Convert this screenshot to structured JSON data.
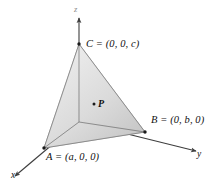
{
  "figure": {
    "type": "3d-coordinate-diagram",
    "background_color": "#ffffff",
    "stroke_color": "#4a4a4a",
    "label_color": "#111111"
  },
  "axes": [
    {
      "name": "x-axis",
      "label": "x",
      "arrow_direction": "down-left"
    },
    {
      "name": "y-axis",
      "label": "y",
      "arrow_direction": "right"
    },
    {
      "name": "z-axis",
      "label": "z",
      "arrow_direction": "up"
    }
  ],
  "vertices": [
    {
      "name": "vertex-A",
      "label": "A = (a, 0, 0)",
      "point": "A",
      "coordinates": "(a, 0, 0)",
      "on_axis": "x"
    },
    {
      "name": "vertex-B",
      "label": "B = (0, b, 0)",
      "point": "B",
      "coordinates": "(0, b, 0)",
      "on_axis": "y"
    },
    {
      "name": "vertex-C",
      "label": "C = (0, 0, c)",
      "point": "C",
      "coordinates": "(0, 0, c)",
      "on_axis": "z"
    }
  ],
  "interior_point": {
    "name": "point-P",
    "label": "P",
    "marker": "dot"
  },
  "faces": [
    {
      "name": "face-ABC",
      "description": "slanted front face through A, B and C",
      "fill_light": "#e9e9e9",
      "fill_dark": "#c6c6c6"
    },
    {
      "name": "face-OAC",
      "description": "face in the xz-plane through origin, A and C",
      "fill_light": "#f5f5f5",
      "fill_dark": "#dcdcdc"
    },
    {
      "name": "face-OBC",
      "description": "face in the yz-plane through origin, B and C",
      "fill_light": "#efefef",
      "fill_dark": "#d2d2d2"
    },
    {
      "name": "face-OAB",
      "description": "base face in the xy-plane through origin, A and B",
      "fill_light": "#f2f2f2",
      "fill_dark": "#cfcfcf"
    }
  ]
}
